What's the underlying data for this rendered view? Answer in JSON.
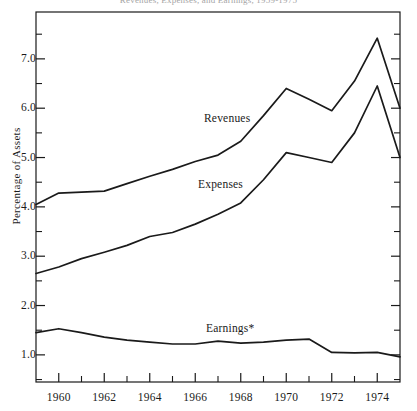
{
  "chart_data": {
    "type": "line",
    "title": "Revenues, Expenses, and Earnings, 1959-1975",
    "xlabel": "",
    "ylabel": "Percentage of Assets",
    "xlim": [
      1959,
      1975
    ],
    "ylim": [
      0.45,
      7.95
    ],
    "grid": false,
    "legend": "inline-labels",
    "x": [
      1959,
      1960,
      1961,
      1962,
      1963,
      1964,
      1965,
      1966,
      1967,
      1968,
      1969,
      1970,
      1971,
      1972,
      1973,
      1974,
      1975
    ],
    "y_ticks": [
      1.0,
      2.0,
      3.0,
      4.0,
      5.0,
      6.0,
      7.0
    ],
    "y_tick_labels": [
      "1.0",
      "2.0",
      "3.0",
      "4.0",
      "5.0",
      "6.0",
      "7.0"
    ],
    "y_minor_ticks": [
      0.5,
      1.5,
      2.5,
      3.5,
      4.5,
      5.5,
      6.5,
      7.5
    ],
    "x_ticks": [
      1960,
      1962,
      1964,
      1966,
      1968,
      1970,
      1972,
      1974
    ],
    "x_tick_labels": [
      "1960",
      "1962",
      "1964",
      "1966",
      "1968",
      "1970",
      "1972",
      "1974"
    ],
    "x_minor_ticks": [
      1961,
      1963,
      1965,
      1967,
      1969,
      1971,
      1973
    ],
    "series": [
      {
        "name": "Revenues",
        "label": "Revenues",
        "color": "#1a1a1a",
        "values": [
          4.05,
          4.28,
          4.3,
          4.32,
          4.47,
          4.62,
          4.76,
          4.92,
          5.05,
          5.33,
          5.85,
          6.4,
          6.18,
          5.95,
          6.55,
          7.42,
          6.0
        ]
      },
      {
        "name": "Expenses",
        "label": "Expenses",
        "color": "#1a1a1a",
        "values": [
          2.65,
          2.78,
          2.95,
          3.08,
          3.22,
          3.4,
          3.48,
          3.65,
          3.85,
          4.08,
          4.55,
          5.1,
          5.0,
          4.9,
          5.5,
          6.45,
          5.0
        ]
      },
      {
        "name": "Earnings*",
        "label": "Earnings*",
        "color": "#1a1a1a",
        "values": [
          1.45,
          1.53,
          1.45,
          1.36,
          1.3,
          1.26,
          1.22,
          1.22,
          1.28,
          1.24,
          1.26,
          1.3,
          1.32,
          1.05,
          1.04,
          1.05,
          0.96
        ]
      }
    ],
    "series_label_positions": [
      {
        "name": "Revenues",
        "x_px": 204,
        "y_px": 112
      },
      {
        "name": "Expenses",
        "x_px": 198,
        "y_px": 178
      },
      {
        "name": "Earnings*",
        "x_px": 206,
        "y_px": 322
      }
    ]
  }
}
